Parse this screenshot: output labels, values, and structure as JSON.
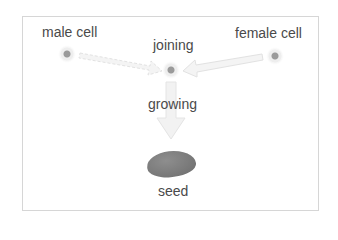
{
  "diagram": {
    "nodes": {
      "male": {
        "label": "male cell"
      },
      "female": {
        "label": "female cell"
      },
      "joining": {
        "label": "joining"
      },
      "growing": {
        "label": "growing"
      },
      "seed": {
        "label": "seed"
      }
    },
    "edges": [
      {
        "from": "male cell",
        "to": "joining"
      },
      {
        "from": "female cell",
        "to": "joining"
      },
      {
        "from": "joining",
        "to": "seed",
        "label": "growing"
      }
    ],
    "colors": {
      "text": "#4a4a4a",
      "frame": "#d6d6d6",
      "arrow_fill": "#f4f4f4",
      "arrow_stroke": "#e2e2e2",
      "cell_core": "#9a9a9a",
      "seed": "#7a7a7a"
    }
  }
}
